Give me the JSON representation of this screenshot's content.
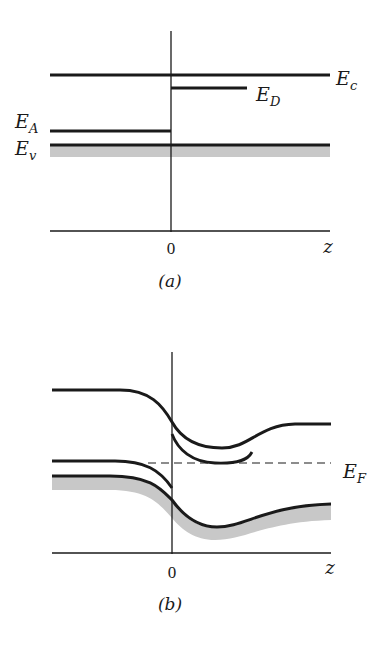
{
  "panel_a": {
    "caption": "(a)",
    "origin_label": "0",
    "axis_label": "z",
    "levels": {
      "Ec": {
        "main": "E",
        "sub": "c"
      },
      "ED": {
        "main": "E",
        "sub": "D"
      },
      "EA": {
        "main": "E",
        "sub": "A"
      },
      "Ev": {
        "main": "E",
        "sub": "v"
      }
    }
  },
  "panel_b": {
    "caption": "(b)",
    "origin_label": "0",
    "axis_label": "z",
    "fermi": {
      "main": "E",
      "sub": "F"
    }
  },
  "colors": {
    "line": "#1a1a1a",
    "band_fill": "#c8c8c8"
  }
}
